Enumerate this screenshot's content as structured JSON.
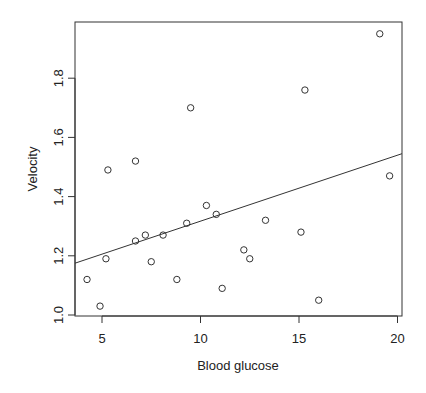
{
  "chart_data": {
    "type": "scatter",
    "title": "",
    "xlabel": "Blood glucose",
    "ylabel": "Velocity",
    "xlim": [
      3.6,
      20.2
    ],
    "ylim": [
      0.99,
      1.99
    ],
    "xticks": [
      5,
      10,
      15,
      20
    ],
    "yticks": [
      1.0,
      1.2,
      1.4,
      1.6,
      1.8
    ],
    "grid": false,
    "legend": null,
    "points": [
      {
        "x": 4.24,
        "y": 1.12
      },
      {
        "x": 4.9,
        "y": 1.03
      },
      {
        "x": 5.2,
        "y": 1.19
      },
      {
        "x": 5.3,
        "y": 1.49
      },
      {
        "x": 6.7,
        "y": 1.52
      },
      {
        "x": 6.7,
        "y": 1.25
      },
      {
        "x": 7.2,
        "y": 1.27
      },
      {
        "x": 7.5,
        "y": 1.18
      },
      {
        "x": 8.1,
        "y": 1.27
      },
      {
        "x": 8.8,
        "y": 1.12
      },
      {
        "x": 9.3,
        "y": 1.31
      },
      {
        "x": 9.5,
        "y": 1.7
      },
      {
        "x": 10.3,
        "y": 1.37
      },
      {
        "x": 10.8,
        "y": 1.34
      },
      {
        "x": 11.1,
        "y": 1.09
      },
      {
        "x": 12.2,
        "y": 1.22
      },
      {
        "x": 12.5,
        "y": 1.19
      },
      {
        "x": 13.3,
        "y": 1.32
      },
      {
        "x": 15.1,
        "y": 1.28
      },
      {
        "x": 15.3,
        "y": 1.76
      },
      {
        "x": 16.0,
        "y": 1.05
      },
      {
        "x": 19.1,
        "y": 1.95
      },
      {
        "x": 19.6,
        "y": 1.47
      }
    ],
    "regression_line": {
      "x0": 3.6,
      "y0": 1.175,
      "x1": 20.2,
      "y1": 1.545
    }
  }
}
